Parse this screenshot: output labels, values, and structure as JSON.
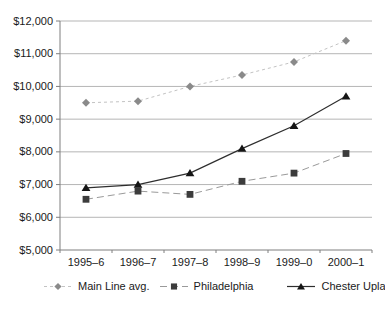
{
  "chart_data": {
    "type": "line",
    "title": "",
    "xlabel": "",
    "ylabel": "",
    "categories": [
      "1995–6",
      "1996–7",
      "1997–8",
      "1998–9",
      "1999–0",
      "2000–1"
    ],
    "series": [
      {
        "name": "Main Line avg.",
        "values": [
          9500,
          9550,
          10000,
          10350,
          10750,
          11400
        ],
        "line_color": "#c3c3c3",
        "line_style": "dashed-short",
        "marker": "diamond",
        "marker_color": "#8a8a8a"
      },
      {
        "name": "Philadelphia",
        "values": [
          6550,
          6800,
          6700,
          7100,
          7350,
          7950
        ],
        "line_color": "#9a9a9a",
        "line_style": "dashed",
        "marker": "square",
        "marker_color": "#3c3c3c"
      },
      {
        "name": "Chester Upland",
        "values": [
          6900,
          7000,
          7350,
          8100,
          8800,
          9700
        ],
        "line_color": "#2e2e2e",
        "line_style": "solid",
        "marker": "triangle-up",
        "marker_color": "#151515"
      }
    ],
    "ylim": [
      5000,
      12000
    ],
    "y_tick_step": 1000,
    "y_tick_labels": [
      "$5,000",
      "$6,000",
      "$7,000",
      "$8,000",
      "$9,000",
      "$10,000",
      "$11,000",
      "$12,000"
    ],
    "grid": "horizontal",
    "legend_position": "bottom",
    "colors": {
      "axis": "#7f7f7f",
      "grid": "#b5b5b5",
      "text": "#1a1a1a",
      "background": "#ffffff"
    }
  }
}
